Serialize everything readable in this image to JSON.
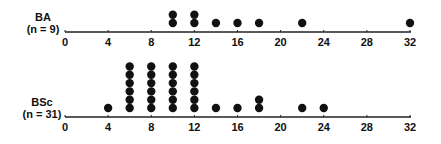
{
  "chart_data": [
    {
      "type": "scatter",
      "subtype": "dot-plot",
      "title": "",
      "group_label": "BA",
      "group_n": "(n = 9)",
      "xlabel": "",
      "ylabel": "",
      "xlim": [
        0,
        32
      ],
      "xticks": [
        0,
        4,
        8,
        12,
        16,
        20,
        24,
        28,
        32
      ],
      "grid": false,
      "points": [
        {
          "x": 10,
          "count": 2
        },
        {
          "x": 12,
          "count": 2
        },
        {
          "x": 14,
          "count": 1
        },
        {
          "x": 16,
          "count": 1
        },
        {
          "x": 18,
          "count": 1
        },
        {
          "x": 22,
          "count": 1
        },
        {
          "x": 32,
          "count": 1
        }
      ]
    },
    {
      "type": "scatter",
      "subtype": "dot-plot",
      "title": "",
      "group_label": "BSc",
      "group_n": "(n = 31)",
      "xlabel": "",
      "ylabel": "",
      "xlim": [
        0,
        32
      ],
      "xticks": [
        0,
        4,
        8,
        12,
        16,
        20,
        24,
        28,
        32
      ],
      "grid": false,
      "points": [
        {
          "x": 4,
          "count": 1
        },
        {
          "x": 6,
          "count": 6
        },
        {
          "x": 8,
          "count": 6
        },
        {
          "x": 10,
          "count": 6
        },
        {
          "x": 12,
          "count": 6
        },
        {
          "x": 14,
          "count": 1
        },
        {
          "x": 16,
          "count": 1
        },
        {
          "x": 18,
          "count": 2
        },
        {
          "x": 22,
          "count": 1
        },
        {
          "x": 24,
          "count": 1
        }
      ]
    }
  ],
  "style": {
    "dot_color": "#111111",
    "axis_color": "#222222"
  }
}
